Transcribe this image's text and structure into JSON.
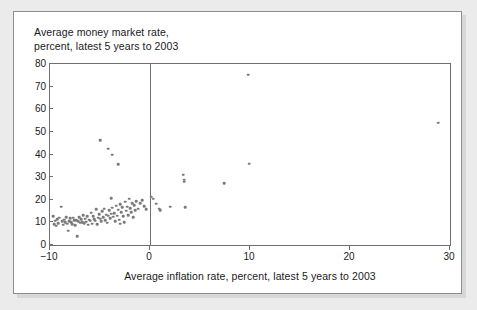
{
  "chart_data": {
    "type": "scatter",
    "title": "Average money market rate,\npercent, latest 5 years to 2003",
    "xlabel": "Average inflation rate, percent, latest 5 years to 2003",
    "ylabel": "Average money market rate, percent, latest 5 years to 2003",
    "xlim": [
      -10,
      30
    ],
    "ylim": [
      0,
      80
    ],
    "xticks": [
      -10,
      0,
      10,
      20,
      30
    ],
    "xtick_labels": [
      "−10",
      "0",
      "10",
      "20",
      "30"
    ],
    "yticks": [
      0,
      10,
      20,
      30,
      40,
      50,
      60,
      70,
      80
    ],
    "ytick_labels": [
      "0",
      "10",
      "20",
      "30",
      "40",
      "50",
      "60",
      "70",
      "80"
    ],
    "grid": false,
    "legend": null,
    "marker_color": "#7a7a7a",
    "axis_color": "#6f6f6f",
    "reference_lines": [
      {
        "orientation": "vertical",
        "x": 0,
        "color": "#6f6f6f"
      }
    ],
    "points": [
      [
        -9.7,
        12.7
      ],
      [
        -9.6,
        9.1
      ],
      [
        -9.5,
        10.8
      ],
      [
        -9.4,
        8.5
      ],
      [
        -9.3,
        11.5
      ],
      [
        -9.2,
        9.6
      ],
      [
        -9.1,
        12.0
      ],
      [
        -8.9,
        16.9
      ],
      [
        -8.8,
        10.4
      ],
      [
        -8.7,
        9.0
      ],
      [
        -8.6,
        11.2
      ],
      [
        -8.5,
        10.1
      ],
      [
        -8.4,
        12.4
      ],
      [
        -8.3,
        9.4
      ],
      [
        -8.2,
        6.3
      ],
      [
        -8.1,
        10.6
      ],
      [
        -8.0,
        11.8
      ],
      [
        -7.9,
        10.2
      ],
      [
        -7.8,
        9.3
      ],
      [
        -7.7,
        12.1
      ],
      [
        -7.6,
        10.9
      ],
      [
        -7.5,
        8.7
      ],
      [
        -7.4,
        11.0
      ],
      [
        -7.3,
        3.8
      ],
      [
        -7.2,
        10.5
      ],
      [
        -7.1,
        12.3
      ],
      [
        -7.0,
        9.9
      ],
      [
        -6.9,
        11.4
      ],
      [
        -6.8,
        10.0
      ],
      [
        -6.7,
        13.1
      ],
      [
        -6.6,
        9.7
      ],
      [
        -6.5,
        11.6
      ],
      [
        -6.4,
        10.3
      ],
      [
        -6.3,
        12.8
      ],
      [
        -6.2,
        8.9
      ],
      [
        -6.1,
        11.1
      ],
      [
        -6.0,
        10.7
      ],
      [
        -5.9,
        14.2
      ],
      [
        -5.8,
        9.5
      ],
      [
        -5.7,
        12.6
      ],
      [
        -5.6,
        11.3
      ],
      [
        -5.5,
        10.8
      ],
      [
        -5.4,
        15.8
      ],
      [
        -5.3,
        9.2
      ],
      [
        -5.2,
        12.0
      ],
      [
        -5.1,
        13.6
      ],
      [
        -5.0,
        11.7
      ],
      [
        -5.0,
        46.3
      ],
      [
        -4.9,
        10.4
      ],
      [
        -4.8,
        14.9
      ],
      [
        -4.7,
        12.2
      ],
      [
        -4.6,
        16.1
      ],
      [
        -4.5,
        11.0
      ],
      [
        -4.4,
        13.4
      ],
      [
        -4.3,
        9.8
      ],
      [
        -4.2,
        42.6
      ],
      [
        -4.2,
        12.9
      ],
      [
        -4.1,
        15.3
      ],
      [
        -4.0,
        11.9
      ],
      [
        -3.9,
        20.8
      ],
      [
        -3.9,
        13.8
      ],
      [
        -3.8,
        40.0
      ],
      [
        -3.8,
        16.5
      ],
      [
        -3.7,
        12.5
      ],
      [
        -3.6,
        14.1
      ],
      [
        -3.5,
        10.6
      ],
      [
        -3.4,
        17.4
      ],
      [
        -3.3,
        13.0
      ],
      [
        -3.2,
        35.7
      ],
      [
        -3.2,
        15.6
      ],
      [
        -3.1,
        11.2
      ],
      [
        -3.0,
        18.1
      ],
      [
        -3.0,
        9.4
      ],
      [
        -2.9,
        14.6
      ],
      [
        -2.8,
        16.8
      ],
      [
        -2.7,
        12.7
      ],
      [
        -2.6,
        10.1
      ],
      [
        -2.5,
        19.1
      ],
      [
        -2.4,
        15.1
      ],
      [
        -2.3,
        17.0
      ],
      [
        -2.2,
        13.3
      ],
      [
        -2.1,
        20.4
      ],
      [
        -2.0,
        16.3
      ],
      [
        -1.9,
        14.5
      ],
      [
        -1.8,
        18.6
      ],
      [
        -1.7,
        12.2
      ],
      [
        -1.6,
        17.7
      ],
      [
        -1.5,
        15.4
      ],
      [
        -1.4,
        19.3
      ],
      [
        -1.2,
        16.0
      ],
      [
        -1.0,
        18.4
      ],
      [
        -0.8,
        19.8
      ],
      [
        -0.6,
        17.2
      ],
      [
        -0.4,
        15.9
      ],
      [
        0.1,
        21.3
      ],
      [
        0.3,
        20.5
      ],
      [
        0.6,
        18.2
      ],
      [
        0.9,
        16.0
      ],
      [
        1.0,
        15.4
      ],
      [
        2.0,
        17.0
      ],
      [
        3.3,
        31.0
      ],
      [
        3.4,
        28.8
      ],
      [
        3.4,
        27.9
      ],
      [
        3.5,
        16.8
      ],
      [
        7.4,
        27.3
      ],
      [
        9.8,
        75.2
      ],
      [
        9.9,
        35.9
      ],
      [
        28.8,
        54.0
      ]
    ]
  }
}
